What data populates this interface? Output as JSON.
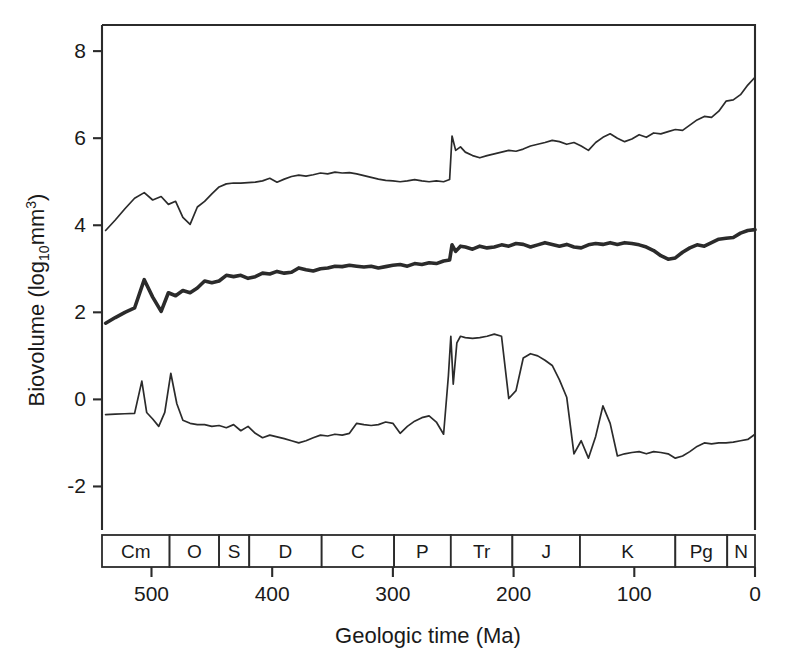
{
  "chart_data": {
    "type": "line",
    "title": "",
    "xlabel": "Geologic time (Ma)",
    "ylabel": "Biovolume (log10mm3)",
    "ylabel_parts": {
      "prefix": "Biovolume (log",
      "sub": "10",
      "mid": "mm",
      "sup": "3",
      "suffix": ")"
    },
    "xlim": [
      541,
      0
    ],
    "ylim": [
      -3.0,
      8.6
    ],
    "x_reversed": true,
    "grid": false,
    "legend": "none",
    "xticks": [
      500,
      400,
      300,
      200,
      100,
      0
    ],
    "xtick_labels": [
      "500",
      "400",
      "300",
      "200",
      "100",
      "0"
    ],
    "yticks": [
      8,
      6,
      4,
      2,
      0,
      -2
    ],
    "ytick_labels": [
      "8",
      "6",
      "4",
      "2",
      "0",
      "-2"
    ],
    "geologic_periods": [
      {
        "abbr": "Cm",
        "start": 541,
        "end": 485
      },
      {
        "abbr": "O",
        "start": 485,
        "end": 444
      },
      {
        "abbr": "S",
        "start": 444,
        "end": 419
      },
      {
        "abbr": "D",
        "start": 419,
        "end": 359
      },
      {
        "abbr": "C",
        "start": 359,
        "end": 299
      },
      {
        "abbr": "P",
        "start": 299,
        "end": 252
      },
      {
        "abbr": "Tr",
        "start": 252,
        "end": 201
      },
      {
        "abbr": "J",
        "start": 201,
        "end": 145
      },
      {
        "abbr": "K",
        "start": 145,
        "end": 66
      },
      {
        "abbr": "Pg",
        "start": 66,
        "end": 23
      },
      {
        "abbr": "N",
        "start": 23,
        "end": 0
      }
    ],
    "series": [
      {
        "name": "maximum-biovolume",
        "style": "thin",
        "x": [
          538,
          530,
          522,
          514,
          506,
          499,
          492,
          486,
          480,
          474,
          468,
          462,
          456,
          450,
          444,
          438,
          432,
          426,
          420,
          414,
          408,
          402,
          396,
          390,
          384,
          378,
          372,
          366,
          360,
          354,
          348,
          342,
          336,
          330,
          324,
          318,
          312,
          306,
          300,
          294,
          288,
          282,
          276,
          270,
          264,
          258,
          253,
          251,
          248,
          244,
          240,
          234,
          228,
          222,
          216,
          210,
          204,
          198,
          192,
          186,
          180,
          174,
          168,
          162,
          156,
          150,
          144,
          138,
          132,
          126,
          120,
          114,
          108,
          102,
          96,
          90,
          84,
          78,
          72,
          66,
          60,
          54,
          48,
          42,
          36,
          30,
          24,
          18,
          12,
          6,
          0
        ],
        "y": [
          3.88,
          4.12,
          4.38,
          4.62,
          4.75,
          4.58,
          4.66,
          4.48,
          4.55,
          4.18,
          4.02,
          4.42,
          4.55,
          4.72,
          4.88,
          4.95,
          4.97,
          4.97,
          4.98,
          4.99,
          5.02,
          5.08,
          4.99,
          5.06,
          5.12,
          5.15,
          5.13,
          5.16,
          5.2,
          5.18,
          5.22,
          5.2,
          5.21,
          5.18,
          5.14,
          5.1,
          5.06,
          5.03,
          5.02,
          5.0,
          5.02,
          5.05,
          5.02,
          5.0,
          5.02,
          5.0,
          5.05,
          6.05,
          5.72,
          5.8,
          5.68,
          5.6,
          5.55,
          5.6,
          5.64,
          5.68,
          5.72,
          5.7,
          5.75,
          5.82,
          5.86,
          5.9,
          5.95,
          5.92,
          5.86,
          5.9,
          5.82,
          5.72,
          5.9,
          6.02,
          6.1,
          6.0,
          5.92,
          5.98,
          6.08,
          6.02,
          6.12,
          6.1,
          6.15,
          6.2,
          6.18,
          6.3,
          6.42,
          6.5,
          6.48,
          6.62,
          6.85,
          6.88,
          7.0,
          7.22,
          7.4
        ]
      },
      {
        "name": "mean-biovolume",
        "style": "thick",
        "x": [
          538,
          530,
          522,
          514,
          506,
          499,
          492,
          486,
          480,
          474,
          468,
          462,
          456,
          450,
          444,
          438,
          432,
          426,
          420,
          414,
          408,
          402,
          396,
          390,
          384,
          378,
          372,
          366,
          360,
          354,
          348,
          342,
          336,
          330,
          324,
          318,
          312,
          306,
          300,
          294,
          288,
          282,
          276,
          270,
          264,
          258,
          253,
          251,
          248,
          244,
          240,
          234,
          228,
          222,
          216,
          210,
          204,
          198,
          192,
          186,
          180,
          174,
          168,
          162,
          156,
          150,
          144,
          138,
          132,
          126,
          120,
          114,
          108,
          102,
          96,
          90,
          84,
          78,
          72,
          66,
          60,
          54,
          48,
          42,
          36,
          30,
          24,
          18,
          12,
          6,
          0
        ],
        "y": [
          1.75,
          1.88,
          2.0,
          2.1,
          2.75,
          2.35,
          2.02,
          2.45,
          2.38,
          2.5,
          2.45,
          2.56,
          2.72,
          2.68,
          2.72,
          2.85,
          2.82,
          2.85,
          2.78,
          2.82,
          2.9,
          2.88,
          2.94,
          2.9,
          2.92,
          3.02,
          2.98,
          2.95,
          3.0,
          3.02,
          3.06,
          3.05,
          3.08,
          3.06,
          3.04,
          3.06,
          3.02,
          3.05,
          3.08,
          3.1,
          3.06,
          3.12,
          3.1,
          3.14,
          3.12,
          3.18,
          3.2,
          3.55,
          3.4,
          3.52,
          3.5,
          3.45,
          3.52,
          3.48,
          3.5,
          3.55,
          3.52,
          3.58,
          3.56,
          3.5,
          3.55,
          3.6,
          3.56,
          3.52,
          3.56,
          3.5,
          3.48,
          3.55,
          3.58,
          3.56,
          3.6,
          3.56,
          3.6,
          3.58,
          3.55,
          3.5,
          3.42,
          3.3,
          3.22,
          3.25,
          3.38,
          3.48,
          3.55,
          3.52,
          3.6,
          3.68,
          3.7,
          3.72,
          3.82,
          3.88,
          3.9
        ]
      },
      {
        "name": "minimum-biovolume",
        "style": "thin",
        "x": [
          538,
          530,
          522,
          514,
          508,
          504,
          499,
          494,
          489,
          484,
          479,
          474,
          468,
          462,
          456,
          450,
          444,
          438,
          432,
          426,
          420,
          414,
          408,
          402,
          396,
          390,
          384,
          378,
          372,
          366,
          360,
          354,
          348,
          342,
          336,
          330,
          324,
          318,
          312,
          306,
          300,
          294,
          288,
          282,
          276,
          270,
          264,
          258,
          254,
          252,
          250,
          247,
          244,
          240,
          234,
          228,
          222,
          216,
          210,
          204,
          198,
          192,
          186,
          180,
          174,
          168,
          162,
          156,
          150,
          144,
          138,
          132,
          126,
          120,
          114,
          108,
          102,
          96,
          90,
          84,
          78,
          72,
          66,
          60,
          54,
          48,
          42,
          36,
          30,
          24,
          18,
          12,
          6,
          0
        ],
        "y": [
          -0.35,
          -0.34,
          -0.33,
          -0.32,
          0.42,
          -0.3,
          -0.45,
          -0.62,
          -0.3,
          0.6,
          -0.1,
          -0.48,
          -0.55,
          -0.58,
          -0.58,
          -0.62,
          -0.6,
          -0.65,
          -0.58,
          -0.72,
          -0.62,
          -0.78,
          -0.88,
          -0.82,
          -0.86,
          -0.9,
          -0.95,
          -1.0,
          -0.95,
          -0.88,
          -0.82,
          -0.84,
          -0.8,
          -0.82,
          -0.78,
          -0.55,
          -0.58,
          -0.6,
          -0.58,
          -0.52,
          -0.55,
          -0.78,
          -0.62,
          -0.5,
          -0.42,
          -0.38,
          -0.52,
          -0.8,
          0.55,
          1.45,
          0.35,
          1.3,
          1.45,
          1.42,
          1.4,
          1.42,
          1.45,
          1.5,
          1.45,
          0.02,
          0.2,
          0.95,
          1.05,
          1.0,
          0.9,
          0.78,
          0.45,
          0.05,
          -1.25,
          -0.95,
          -1.35,
          -0.85,
          -0.15,
          -0.55,
          -1.3,
          -1.25,
          -1.22,
          -1.2,
          -1.25,
          -1.2,
          -1.22,
          -1.25,
          -1.35,
          -1.3,
          -1.2,
          -1.08,
          -1.0,
          -1.02,
          -1.0,
          -1.0,
          -0.98,
          -0.95,
          -0.92,
          -0.8
        ]
      }
    ]
  },
  "layout": {
    "plot_left": 102,
    "plot_right": 755,
    "plot_top": 25,
    "plot_bottom": 530,
    "period_bar_top": 535,
    "period_bar_bottom": 567
  }
}
